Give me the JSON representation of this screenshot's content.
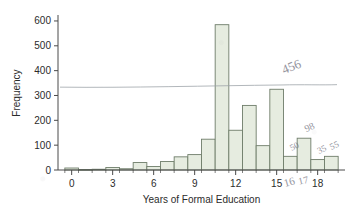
{
  "chart_data": {
    "type": "bar",
    "title": "",
    "subtitle": "",
    "xlabel": "Years of Formal Education",
    "ylabel": "Frequency",
    "xlim": [
      -1,
      20
    ],
    "ylim": [
      0,
      620
    ],
    "grid": false,
    "legend": null,
    "bin_width": 1,
    "x_tick_labels": [
      "0",
      "3",
      "6",
      "9",
      "12",
      "15",
      "18"
    ],
    "x_tick_values": [
      0,
      3,
      6,
      9,
      12,
      15,
      18
    ],
    "y_tick_labels": [
      "0",
      "100",
      "200",
      "300",
      "400",
      "500",
      "600"
    ],
    "y_tick_values": [
      0,
      100,
      200,
      300,
      400,
      500,
      600
    ],
    "categories": [
      "0",
      "1",
      "2",
      "3",
      "4",
      "5",
      "6",
      "7",
      "8",
      "9",
      "10",
      "11",
      "12",
      "13",
      "14",
      "15",
      "16",
      "17",
      "18",
      "19"
    ],
    "values": [
      8,
      2,
      3,
      10,
      5,
      30,
      14,
      34,
      53,
      62,
      124,
      585,
      160,
      260,
      98,
      325,
      55,
      128,
      42,
      55
    ],
    "bar_fill": "#e6ece0",
    "bar_stroke": "#6f7d6a",
    "axis_color": "#4a4a4a"
  },
  "annotations": {
    "overlay_line": {
      "label": "hand-drawn horizontal reference line",
      "y_value": 340,
      "color": "#9aa0a6"
    },
    "handwritten": [
      {
        "id": "ann-456",
        "text": "456",
        "x_value": 16.2,
        "y_value": 400
      },
      {
        "id": "ann-50",
        "text": "50",
        "x_value": 16.4,
        "y_value": 85
      },
      {
        "id": "ann-98",
        "text": "98",
        "x_value": 17.5,
        "y_value": 160
      },
      {
        "id": "ann-35",
        "text": "35",
        "x_value": 18.4,
        "y_value": 72
      },
      {
        "id": "ann-55",
        "text": "55",
        "x_value": 19.3,
        "y_value": 88
      },
      {
        "id": "ann-16",
        "text": "16",
        "x_value": 16.0,
        "y_value": -62
      },
      {
        "id": "ann-17",
        "text": "17",
        "x_value": 17.0,
        "y_value": -55
      }
    ]
  }
}
